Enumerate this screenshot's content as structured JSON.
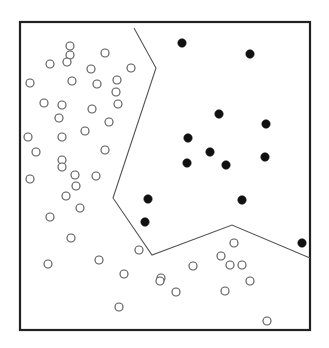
{
  "figure": {
    "title": "",
    "width": 329,
    "height": 348,
    "background_color": "#ffffff"
  },
  "frame": {
    "x": 20,
    "y": 22,
    "width": 290,
    "height": 308,
    "stroke_color": "#222222",
    "stroke_width": 2.2,
    "fill_color": "#ffffff"
  },
  "chart_data": {
    "type": "scatter",
    "title": "",
    "subtitle": "",
    "xlabel": "",
    "ylabel": "",
    "xlim": [
      20,
      310
    ],
    "ylim": [
      22,
      330
    ],
    "grid": false,
    "legend": null,
    "axes_visible": false,
    "tick_labels_x": [],
    "tick_labels_y": [],
    "annotations": [],
    "series": [
      {
        "name": "class-open",
        "marker": "open-circle",
        "marker_radius": 4.0,
        "fill_color": "#ffffff",
        "stroke_color": "#5a5a5a",
        "count": 49,
        "points": [
          [
            70,
            46
          ],
          [
            70,
            55
          ],
          [
            67,
            62
          ],
          [
            105,
            53
          ],
          [
            50,
            64
          ],
          [
            91,
            69
          ],
          [
            131,
            68
          ],
          [
            30,
            83
          ],
          [
            72,
            81
          ],
          [
            97,
            84
          ],
          [
            117,
            80
          ],
          [
            116,
            92
          ],
          [
            62,
            105
          ],
          [
            92,
            109
          ],
          [
            59,
            118
          ],
          [
            28,
            137
          ],
          [
            62,
            137
          ],
          [
            62,
            160
          ],
          [
            62,
            167
          ],
          [
            30,
            179
          ],
          [
            75,
            175
          ],
          [
            76,
            186
          ],
          [
            66,
            196
          ],
          [
            80,
            208
          ],
          [
            50,
            217
          ],
          [
            71,
            238
          ],
          [
            48,
            264
          ],
          [
            99,
            260
          ],
          [
            124,
            274
          ],
          [
            161,
            278
          ],
          [
            119,
            307
          ],
          [
            176,
            292
          ],
          [
            160,
            281
          ],
          [
            193,
            266
          ],
          [
            221,
            256
          ],
          [
            234,
            243
          ],
          [
            230,
            265
          ],
          [
            242,
            265
          ],
          [
            250,
            281
          ],
          [
            225,
            291
          ],
          [
            267,
            321
          ],
          [
            96,
            176
          ],
          [
            109,
            122
          ],
          [
            118,
            104
          ],
          [
            85,
            131
          ],
          [
            44,
            103
          ],
          [
            36,
            152
          ],
          [
            105,
            150
          ],
          [
            139,
            250
          ]
        ]
      },
      {
        "name": "class-filled",
        "marker": "filled-circle",
        "marker_radius": 4.2,
        "fill_color": "#111111",
        "stroke_color": "#111111",
        "count": 13,
        "points": [
          [
            182,
            43
          ],
          [
            250,
            54
          ],
          [
            219,
            114
          ],
          [
            266,
            124
          ],
          [
            188,
            138
          ],
          [
            187,
            163
          ],
          [
            226,
            165
          ],
          [
            265,
            157
          ],
          [
            148,
            199
          ],
          [
            145,
            222
          ],
          [
            242,
            200
          ],
          [
            302,
            243
          ],
          [
            210,
            152
          ]
        ]
      }
    ],
    "decision_boundary": {
      "name": "class-separating-boundary",
      "stroke_color": "#555555",
      "stroke_width": 1.1,
      "vertices": [
        [
          134,
          28
        ],
        [
          156,
          68
        ],
        [
          113,
          198
        ],
        [
          152,
          255
        ],
        [
          232,
          225
        ],
        [
          310,
          258
        ]
      ]
    }
  }
}
